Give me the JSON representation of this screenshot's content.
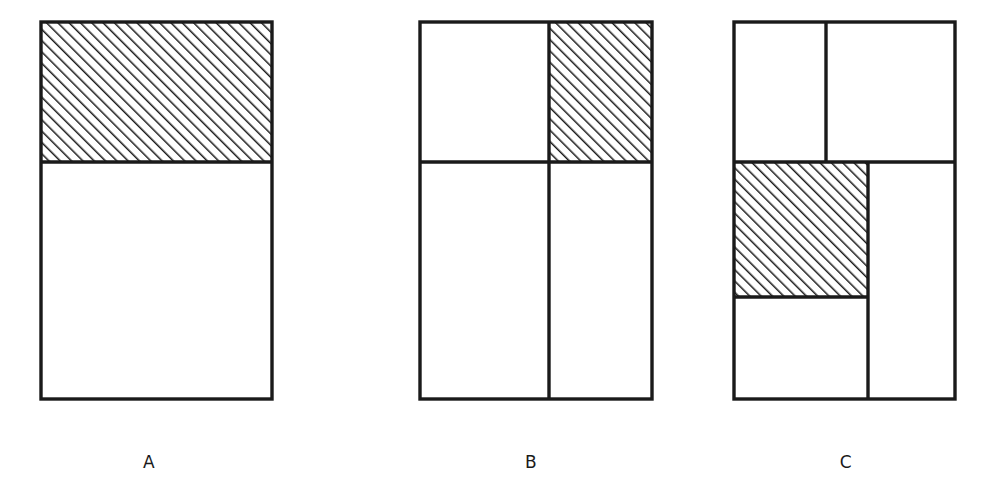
{
  "figure": {
    "background_color": "#ffffff",
    "stroke_color": "#1a1a1a",
    "hatch_color": "#1a1a1a",
    "hatch_angle_deg": 45,
    "hatch_direction": "top-left to bottom-right",
    "hatch_spacing_px": 8,
    "canvas": {
      "width": 988,
      "height": 495
    }
  },
  "panels": [
    {
      "id": "A",
      "label": "A",
      "label_x": 149,
      "label_y": 465,
      "outer_rect": {
        "x": 41,
        "y": 22,
        "width": 231,
        "height": 377
      },
      "divisions": [
        {
          "name": "top-band",
          "x": 41,
          "y": 22,
          "width": 231,
          "height": 140,
          "shaded": true
        },
        {
          "name": "bottom-band",
          "x": 41,
          "y": 162,
          "width": 231,
          "height": 237,
          "shaded": false
        }
      ],
      "internal_lines": [
        {
          "orientation": "horizontal",
          "x1": 41,
          "y1": 162,
          "x2": 272,
          "y2": 162
        }
      ],
      "shaded_count": 1,
      "region_count": 2
    },
    {
      "id": "B",
      "label": "B",
      "label_x": 531,
      "label_y": 465,
      "outer_rect": {
        "x": 420,
        "y": 22,
        "width": 232,
        "height": 377
      },
      "divisions": [
        {
          "name": "top-left",
          "x": 420,
          "y": 22,
          "width": 129,
          "height": 140,
          "shaded": false
        },
        {
          "name": "top-right",
          "x": 549,
          "y": 22,
          "width": 103,
          "height": 140,
          "shaded": true
        },
        {
          "name": "bottom-left",
          "x": 420,
          "y": 162,
          "width": 129,
          "height": 237,
          "shaded": false
        },
        {
          "name": "bottom-right",
          "x": 549,
          "y": 162,
          "width": 103,
          "height": 237,
          "shaded": false
        }
      ],
      "internal_lines": [
        {
          "orientation": "horizontal",
          "x1": 420,
          "y1": 162,
          "x2": 652,
          "y2": 162
        },
        {
          "orientation": "vertical",
          "x1": 549,
          "y1": 22,
          "x2": 549,
          "y2": 399
        }
      ],
      "shaded_count": 1,
      "region_count": 4
    },
    {
      "id": "C",
      "label": "C",
      "label_x": 846,
      "label_y": 465,
      "outer_rect": {
        "x": 734,
        "y": 22,
        "width": 221,
        "height": 377
      },
      "divisions": [
        {
          "name": "top-left",
          "x": 734,
          "y": 22,
          "width": 92,
          "height": 140,
          "shaded": false
        },
        {
          "name": "top-right",
          "x": 826,
          "y": 22,
          "width": 129,
          "height": 140,
          "shaded": false
        },
        {
          "name": "middle-left",
          "x": 734,
          "y": 162,
          "width": 134,
          "height": 135,
          "shaded": true
        },
        {
          "name": "lower-left",
          "x": 734,
          "y": 297,
          "width": 134,
          "height": 102,
          "shaded": false
        },
        {
          "name": "right-tall",
          "x": 868,
          "y": 162,
          "width": 87,
          "height": 237,
          "shaded": false
        }
      ],
      "internal_lines": [
        {
          "orientation": "vertical",
          "x1": 826,
          "y1": 22,
          "x2": 826,
          "y2": 162
        },
        {
          "orientation": "horizontal",
          "x1": 734,
          "y1": 162,
          "x2": 955,
          "y2": 162
        },
        {
          "orientation": "vertical",
          "x1": 868,
          "y1": 162,
          "x2": 868,
          "y2": 399
        },
        {
          "orientation": "horizontal",
          "x1": 734,
          "y1": 297,
          "x2": 868,
          "y2": 297
        }
      ],
      "shaded_count": 1,
      "region_count": 5
    }
  ]
}
